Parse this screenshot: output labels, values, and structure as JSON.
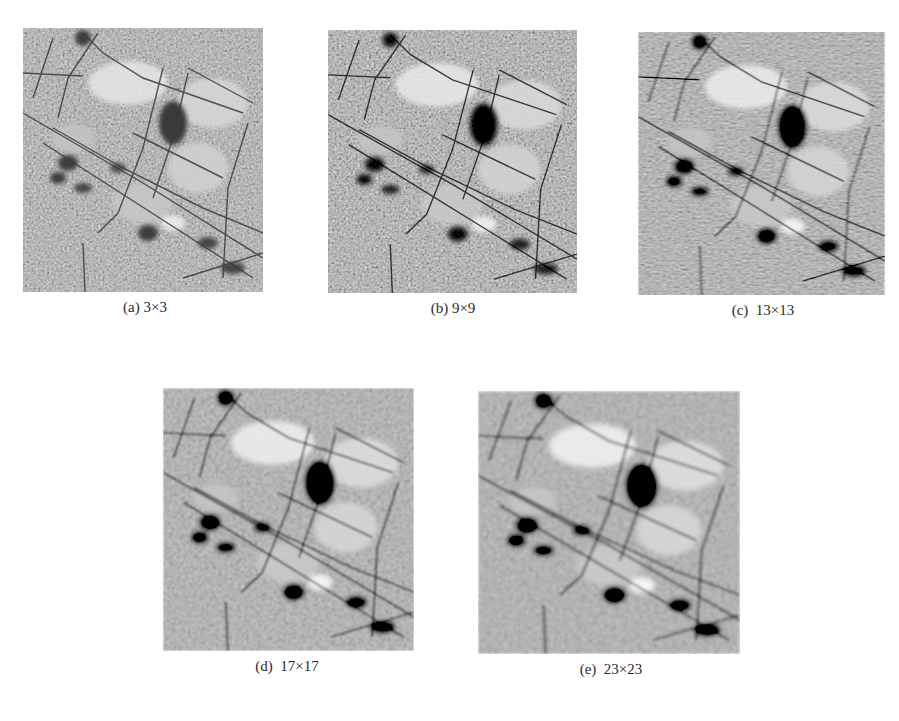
{
  "figure": {
    "panels": [
      {
        "id": "a",
        "caption": "(a) 3×3",
        "window_size": "3×3",
        "blur": 0.35,
        "contrast": 1.0
      },
      {
        "id": "b",
        "caption": "(b) 9×9",
        "window_size": "9×9",
        "blur": 0.6,
        "contrast": 1.1
      },
      {
        "id": "c",
        "caption": "(c)  13×13",
        "window_size": "13×13",
        "blur": 0.85,
        "contrast": 1.2
      },
      {
        "id": "d",
        "caption": "(d)  17×17",
        "window_size": "17×17",
        "blur": 1.2,
        "contrast": 1.3
      },
      {
        "id": "e",
        "caption": "(e)  23×23",
        "window_size": "23×23",
        "blur": 1.6,
        "contrast": 1.4
      }
    ],
    "colors": {
      "background": "#ffffff",
      "image_base": "#8f8f8f",
      "road": "#3a3a3a",
      "bright": "#e8e8e8",
      "dark": "#2e2e2e"
    }
  }
}
